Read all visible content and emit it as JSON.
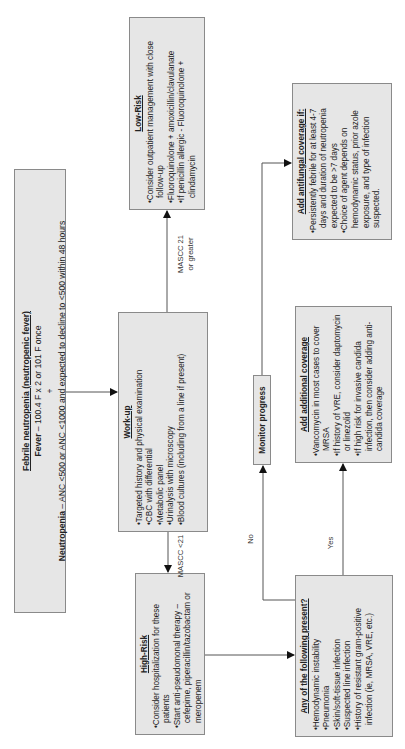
{
  "title_box": {
    "title": "Febrile neutropenia (neutropenic fever)",
    "fever_label": "Fever",
    "fever_text": " – 100.4 F x 2 or 101 F once",
    "plus": "+",
    "neutropenia_label": "Neutropenia",
    "neutropenia_text": " – ANC <500 or ANC <1000 and expected to decline to <500 within 48 hours"
  },
  "workup": {
    "heading": "Work-up",
    "items": [
      "Targeted history and physical examination",
      "CBC with differential",
      "Metabolic panel",
      "Urinalysis with microscopy",
      "Blood cultures (including from a line if present)"
    ]
  },
  "low_risk": {
    "heading": "Low-Risk",
    "items": [
      "Consider outpatient management with close follow-up",
      "Fluoroquinolone + amoxicillin/clavulanate",
      "If penicillin allergic - Fluoroquinolone + clindamycin"
    ]
  },
  "high_risk": {
    "heading": "High-Risk",
    "items": [
      "Consider hospitalization for these patients",
      "Start anti-pseudomonal therapy – cefepime, piperacillin/tazobactam or meropenem"
    ]
  },
  "any_present": {
    "heading": "Any of the following present?",
    "items": [
      "Hemodynamic instability",
      "Pneumonia",
      "Skin/soft-tissue infection",
      "Suspected line infection",
      "History of resistant gram-positive infection (ie, MRSA, VRE, etc.)"
    ]
  },
  "monitor": {
    "label": "Monitor progress"
  },
  "add_coverage": {
    "heading": "Add additional coverage",
    "items": [
      "Vancomycin in most cases to cover MRSA",
      "If history of VRE, consider daptomycin or linezolid",
      "If high risk for invasive candida infection, then consider adding anti-candida coverage"
    ]
  },
  "antifungal": {
    "heading": "Add antifungal coverage if:",
    "items": [
      "Persistently febrile for at least 4-7 days and duration of neutropenia expected to be >7 days",
      "Choice of agent depends on hemodynamic status, prior azole exposure, and type of infection suspected."
    ]
  },
  "edge_labels": {
    "mascc_low_1": "MASCC 21",
    "mascc_low_2": "or greater",
    "mascc_high": "MASCC <21",
    "no": "No",
    "yes": "Yes"
  },
  "colors": {
    "box_fill": "#e6e6e6",
    "box_border": "#8a8a8a",
    "line": "#555555",
    "arrow": "#111111"
  }
}
